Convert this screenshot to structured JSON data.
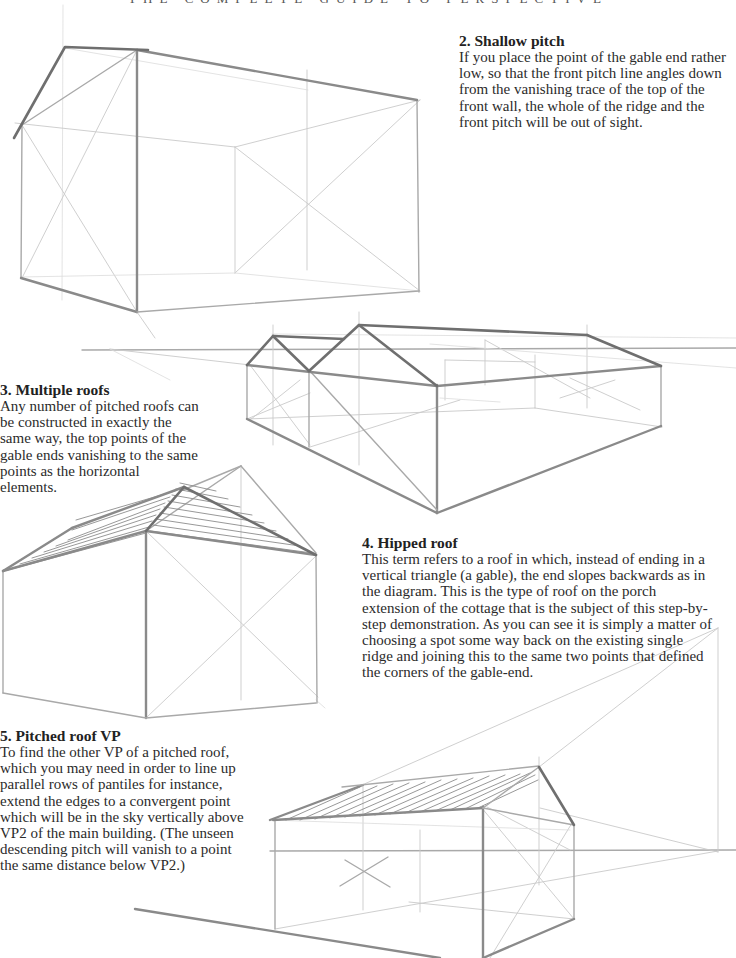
{
  "page": {
    "running_head": "THE COMPLETE GUIDE TO PERSPECTIVE"
  },
  "sections": [
    {
      "heading": "2. Shallow pitch",
      "body": "If you place the point of the gable end rather low, so that the front pitch line angles down from the vanishing trace of the top of the front wall, the whole of the ridge and the front pitch will be out of sight."
    },
    {
      "heading": "3. Multiple roofs",
      "body": "Any number of pitched roofs can be constructed in exactly the same way, the top points of the gable ends vanishing to the same points as the horizontal elements."
    },
    {
      "heading": "4. Hipped roof",
      "body": "This term refers to a roof in which, instead of ending in a vertical triangle (a gable), the end slopes backwards as in the diagram. This is the type of roof on the porch extension of the cottage that is the subject of this step-by-step demonstration. As you can see it is simply a matter of choosing a spot some way back on the existing single ridge and joining this to the same two points that defined the corners of the gable-end."
    },
    {
      "heading": "5. Pitched roof VP",
      "body": "To find the other VP of a pitched roof, which you may need in order to line up parallel rows of pantiles for instance, extend the edges to a convergent point which will be in the sky vertically above VP2 of the main building. (The unseen descending pitch will vanish to a point the same distance below VP2.)"
    }
  ],
  "illustrations": [
    {
      "name": "shallow-pitch-drawing",
      "subject": "shallow pitch gable building"
    },
    {
      "name": "multiple-roofs-drawing",
      "subject": "building with two pitched roofs"
    },
    {
      "name": "hipped-roof-drawing",
      "subject": "hipped roof building with hatched roof planes"
    },
    {
      "name": "pitched-roof-vp-drawing",
      "subject": "pitched roof with vanishing point above VP2"
    }
  ],
  "colors": {
    "text": "#2b2b2b",
    "pencil_dark": "#6f6f6f",
    "pencil_light": "#c9c9c9",
    "background": "#ffffff"
  }
}
